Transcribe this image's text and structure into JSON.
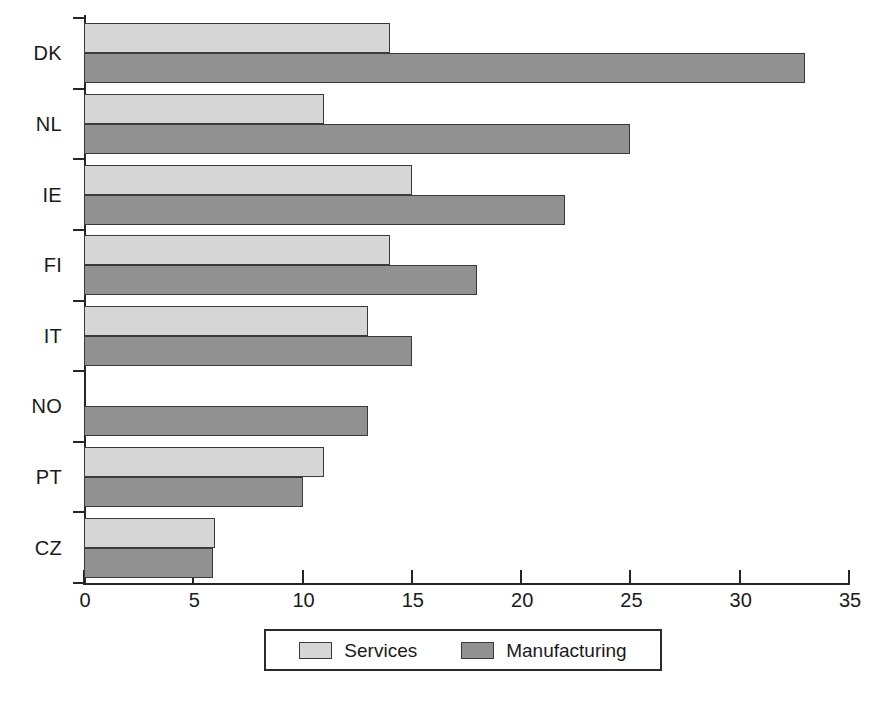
{
  "chart_data": {
    "type": "bar",
    "orientation": "horizontal",
    "title": "",
    "subtitle": "",
    "xlabel": "",
    "ylabel": "",
    "xlim": [
      0,
      35
    ],
    "xticks": [
      "0",
      "5",
      "10",
      "15",
      "20",
      "25",
      "30",
      "35"
    ],
    "xtick_values": [
      0,
      5,
      10,
      15,
      20,
      25,
      30,
      35
    ],
    "grid": false,
    "legend_position": "bottom-center",
    "categories": [
      "DK",
      "NL",
      "IE",
      "FI",
      "IT",
      "NO",
      "PT",
      "CZ"
    ],
    "series": [
      {
        "name": "Services",
        "color": "#d6d6d6",
        "values": [
          14,
          11,
          15,
          14,
          13,
          null,
          11,
          6
        ]
      },
      {
        "name": "Manufacturing",
        "color": "#919191",
        "values": [
          33,
          25,
          22,
          18,
          15,
          13,
          10,
          5.9
        ]
      }
    ]
  },
  "legend": {
    "entries": [
      {
        "label": "Services",
        "swatch": "services-swatch"
      },
      {
        "label": "Manufacturing",
        "swatch": "manufacturing-swatch"
      }
    ]
  },
  "colors": {
    "services": "#d6d6d6",
    "manufacturing": "#919191",
    "axis": "#262626",
    "bar_border": "#3a3a3a",
    "background": "#ffffff"
  }
}
